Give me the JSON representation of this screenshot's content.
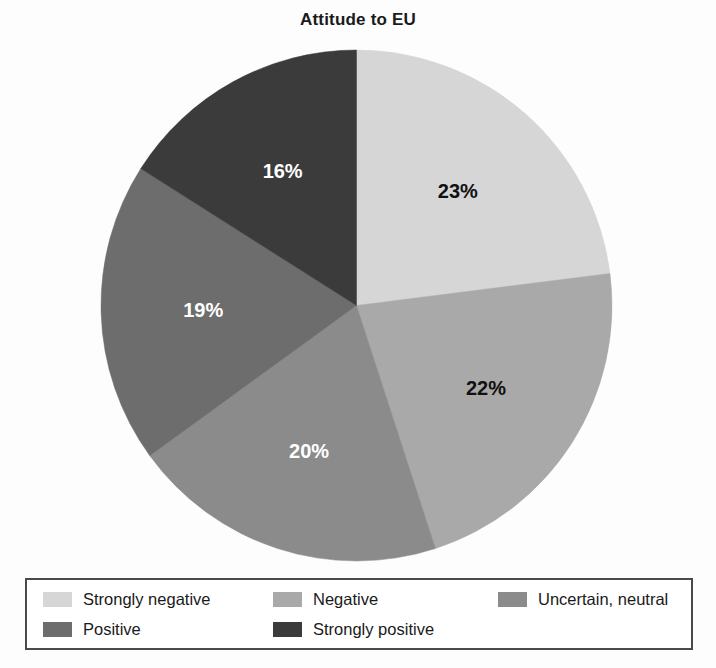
{
  "chart_data": {
    "type": "pie",
    "title": "Attitude to EU",
    "xlabel": "",
    "ylabel": "",
    "legend_position": "bottom",
    "grid": false,
    "categories": [
      "Strongly negative",
      "Negative",
      "Uncertain, neutral",
      "Positive",
      "Strongly positive"
    ],
    "values": [
      23,
      22,
      20,
      19,
      16
    ],
    "value_labels": [
      "23%",
      "22%",
      "20%",
      "19%",
      "16%"
    ],
    "colors": [
      "#d6d6d6",
      "#a9a9a9",
      "#8b8b8b",
      "#6d6d6d",
      "#3b3b3b"
    ],
    "label_colors": [
      "#111111",
      "#111111",
      "#ffffff",
      "#ffffff",
      "#ffffff"
    ],
    "start_angle_deg": 0,
    "direction": "clockwise",
    "slices": [
      {
        "name": "Strongly negative",
        "value": 23,
        "label": "23%",
        "color": "#d6d6d6",
        "label_color": "#111111"
      },
      {
        "name": "Negative",
        "value": 22,
        "label": "22%",
        "color": "#a9a9a9",
        "label_color": "#111111"
      },
      {
        "name": "Uncertain, neutral",
        "value": 20,
        "label": "20%",
        "color": "#8b8b8b",
        "label_color": "#ffffff"
      },
      {
        "name": "Positive",
        "value": 19,
        "label": "19%",
        "color": "#6d6d6d",
        "label_color": "#ffffff"
      },
      {
        "name": "Strongly positive",
        "value": 16,
        "label": "16%",
        "color": "#3b3b3b",
        "label_color": "#ffffff"
      }
    ]
  },
  "title": {
    "text": "Attitude to EU"
  },
  "legend": {
    "items": [
      {
        "label": "Strongly negative",
        "color": "#d6d6d6"
      },
      {
        "label": "Negative",
        "color": "#a9a9a9"
      },
      {
        "label": "Uncertain, neutral",
        "color": "#8b8b8b"
      },
      {
        "label": "Positive",
        "color": "#6d6d6d"
      },
      {
        "label": "Strongly positive",
        "color": "#3b3b3b"
      }
    ]
  }
}
